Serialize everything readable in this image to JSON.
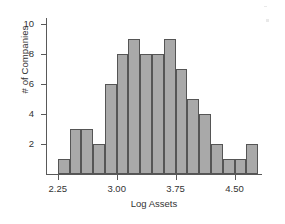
{
  "chart_data": {
    "type": "bar",
    "title": "",
    "subtitle": "",
    "xlabel": "Log Assets",
    "ylabel": "# of Companies",
    "grid": false,
    "legend": false,
    "bar_color": "#a9a9a9",
    "bar_edge_color": "#555555",
    "axis_color": "#595959",
    "bin_width": 0.15,
    "x_start": 2.25,
    "categories": [
      "2.25-2.40",
      "2.40-2.55",
      "2.55-2.70",
      "2.70-2.85",
      "2.85-3.00",
      "3.00-3.15",
      "3.15-3.30",
      "3.30-3.45",
      "3.45-3.60",
      "3.60-3.75",
      "3.75-3.90",
      "3.90-4.05",
      "4.05-4.20",
      "4.20-4.35",
      "4.35-4.50",
      "4.50-4.65",
      "4.65-4.80"
    ],
    "values": [
      1,
      3,
      3,
      2,
      6,
      8,
      9,
      8,
      8,
      9,
      7,
      5,
      4,
      2,
      1,
      1,
      2
    ],
    "xlim": [
      2.1,
      4.85
    ],
    "ylim": [
      0,
      10.4
    ],
    "xticks": [
      2.25,
      3.0,
      3.75,
      4.5
    ],
    "xtick_labels": [
      "2.25",
      "3.00",
      "3.75",
      "4.50"
    ],
    "yticks": [
      2,
      4,
      6,
      8,
      10
    ],
    "ytick_labels": [
      "2",
      "4",
      "6",
      "8",
      "10"
    ]
  }
}
